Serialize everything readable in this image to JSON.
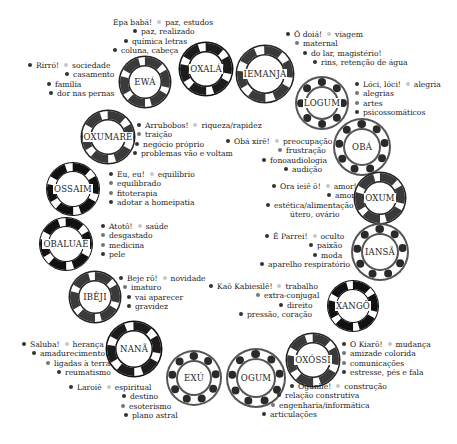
{
  "orixas": [
    {
      "id": "oxala",
      "name": "OXALÁ"
    },
    {
      "id": "iemanja",
      "name": "IEMANJÁ"
    },
    {
      "id": "ewa",
      "name": "EWÁ"
    },
    {
      "id": "logum",
      "name": "LOGUM"
    },
    {
      "id": "oxumare",
      "name": "OXUMARÊ"
    },
    {
      "id": "oba",
      "name": "OBÁ"
    },
    {
      "id": "ossaim",
      "name": "OSSAIM"
    },
    {
      "id": "oxum",
      "name": "OXUM"
    },
    {
      "id": "obaluae",
      "name": "OBALUAÊ"
    },
    {
      "id": "iansa",
      "name": "IANSÃ"
    },
    {
      "id": "ibeji",
      "name": "IBÊJI"
    },
    {
      "id": "xango",
      "name": "XANGÔ"
    },
    {
      "id": "nana",
      "name": "NANÃ"
    },
    {
      "id": "oxossi",
      "name": "OXÓSSI"
    },
    {
      "id": "exu",
      "name": "EXÚ"
    },
    {
      "id": "ogum",
      "name": "OGUM"
    }
  ],
  "labels": {
    "oxala": {
      "greeting": "Epa babá!",
      "keyword": "paz, estudos",
      "items": [
        "paz, realizado",
        "química letras",
        "coluna, cabeça"
      ]
    },
    "iemanja": {
      "greeting": "Ó doiá!",
      "keyword": "viagem",
      "items": [
        "maternal",
        "do lar, magistério!",
        "rins, retenção de água"
      ]
    },
    "ewa": {
      "greeting": "Rirró!",
      "keyword": "sociedade",
      "items": [
        "casamento",
        "família",
        "dor nas pernas"
      ]
    },
    "logum": {
      "greeting": "Lóci, lóci!",
      "keyword": "alegria",
      "items": [
        "alegrias",
        "artes",
        "psicossomáticos"
      ]
    },
    "oxumare": {
      "greeting": "Arrubobos!",
      "keyword": "riqueza/rapidez",
      "items": [
        "traição",
        "negócio próprio",
        "problemas vão e voltam"
      ]
    },
    "oba": {
      "greeting": "Obá xirê!",
      "keyword": "preocupação",
      "items": [
        "frustração",
        "fonoaudiologia",
        "audição"
      ]
    },
    "ossaim": {
      "greeting": "Eu, eu!",
      "keyword": "equilíbrio",
      "items": [
        "equilibrado",
        "fitoterapia",
        "adotar a homeipatia"
      ]
    },
    "oxum": {
      "greeting": "Ora ieiê ô!",
      "keyword": "amor!",
      "items": [
        "amor!",
        "estética/alimentação",
        "útero, ovário"
      ]
    },
    "obaluae": {
      "greeting": "Atotô!",
      "keyword": "saúde",
      "items": [
        "desgastado",
        "medicina",
        "pele"
      ]
    },
    "iansa": {
      "greeting": "É Parrei!",
      "keyword": "oculto",
      "items": [
        "paixão",
        "moda",
        "aparelho respiratório"
      ]
    },
    "ibeji": {
      "greeting": "Beje rô!",
      "keyword": "novidade",
      "items": [
        "imaturo",
        "vai aparecer",
        "gravidez"
      ]
    },
    "xango": {
      "greeting": "Kaô Kabiesilê!",
      "keyword": "trabalho",
      "items": [
        "extra-conjugal",
        "direito",
        "pressão, coração"
      ]
    },
    "nana": {
      "greeting": "Saluba!",
      "keyword": "herança",
      "items": [
        "amadurecimento",
        "ligadas à terra",
        "reumatismo"
      ]
    },
    "oxossi": {
      "greeting": "O Kiarô!",
      "keyword": "mudança",
      "items": [
        "amizade colorida",
        "comunicações",
        "estresse, pés e fala"
      ]
    },
    "exu": {
      "greeting": "Laroiê",
      "keyword": "espiritual",
      "items": [
        "destino",
        "esoterismo",
        "plano astral"
      ]
    },
    "ogum": {
      "greeting": "Ogunhê!",
      "keyword": "construção",
      "items": [
        "relação construtiva",
        "engenharia/informática",
        "articulações"
      ]
    }
  }
}
